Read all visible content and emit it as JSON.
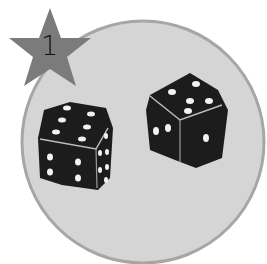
{
  "badge": {
    "number": "1",
    "shape": "star-icon",
    "color": "#7a7a7a"
  },
  "background": {
    "circle_fill": "#d4d4d4",
    "circle_rim": "#a8a8a8"
  },
  "dice": [
    {
      "name": "left-die",
      "top_face": 6,
      "left_face": 4,
      "right_face": 6
    },
    {
      "name": "right-die",
      "top_face": 5,
      "left_face": 2,
      "right_face": 1
    }
  ]
}
